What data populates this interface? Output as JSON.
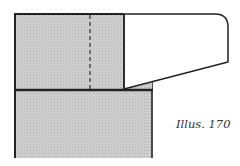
{
  "caption": "Illus. 170",
  "colors": {
    "shade": "#c8c8c8",
    "line": "#222222",
    "background": "#ffffff",
    "white_piece": "#ffffff"
  },
  "diagram": {
    "parts": [
      {
        "name": "upper-block",
        "fill": "shaded"
      },
      {
        "name": "hidden-line",
        "style": "dashed"
      },
      {
        "name": "overhanging-piece",
        "fill": "white"
      },
      {
        "name": "lower-block",
        "fill": "shaded"
      }
    ]
  }
}
